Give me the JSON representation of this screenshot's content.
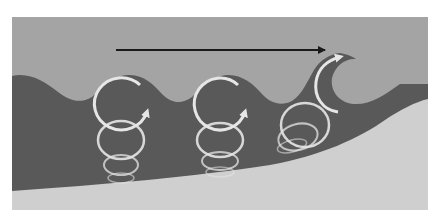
{
  "diagram": {
    "frame": {
      "x": 12,
      "y": 17,
      "width": 416,
      "height": 193
    },
    "colors": {
      "background": "#ffffff",
      "air": "#a4a4a4",
      "water": "#595959",
      "seabed": "#cfcfcf",
      "orbit": "#e6e6e6",
      "arrow": "#1a1a1a"
    },
    "propagation_arrow": {
      "x1": 116,
      "y1": 50,
      "x2": 325,
      "y2": 50,
      "direction": "right"
    },
    "orbit_groups": [
      {
        "name": "deep-water-orbits",
        "cx": 121,
        "circles": [
          {
            "cy": 104,
            "rx": 27,
            "ry": 26,
            "opacity": 1.0,
            "stroke": 3
          },
          {
            "cy": 140,
            "rx": 23,
            "ry": 19,
            "opacity": 0.9,
            "stroke": 2.5
          },
          {
            "cy": 165,
            "rx": 17,
            "ry": 10,
            "opacity": 0.75,
            "stroke": 2
          },
          {
            "cy": 178,
            "rx": 13,
            "ry": 5,
            "opacity": 0.55,
            "stroke": 1.5
          }
        ]
      },
      {
        "name": "intermediate-orbits",
        "cx": 220,
        "circles": [
          {
            "cy": 104,
            "rx": 26,
            "ry": 26,
            "opacity": 1.0,
            "stroke": 3
          },
          {
            "cy": 140,
            "rx": 23,
            "ry": 17,
            "opacity": 0.9,
            "stroke": 2.5
          },
          {
            "cy": 161,
            "rx": 18,
            "ry": 9,
            "opacity": 0.75,
            "stroke": 2
          },
          {
            "cy": 172,
            "rx": 14,
            "ry": 5,
            "opacity": 0.55,
            "stroke": 1.5
          }
        ]
      },
      {
        "name": "breaking-orbits",
        "cx": 300,
        "circles": [
          {
            "cy": 125,
            "rx": 24,
            "ry": 22,
            "opacity": 0.9,
            "stroke": 2.5
          },
          {
            "cy": 137,
            "rx": 20,
            "ry": 13,
            "opacity": 0.75,
            "stroke": 2
          },
          {
            "cy": 146,
            "rx": 15,
            "ry": 6,
            "opacity": 0.55,
            "stroke": 1.5
          }
        ]
      }
    ]
  }
}
